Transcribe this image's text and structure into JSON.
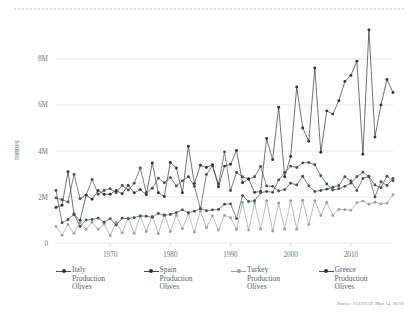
{
  "figure": {
    "background_color": "#ffffff",
    "top_rule_color": "#d8dadf",
    "source_note": "Source: FAOSTAT (Mar 14, 2019)"
  },
  "axis": {
    "ylabel": "tonnes",
    "ytick_labels": [
      "0",
      "2M",
      "4M",
      "6M",
      "8M"
    ],
    "xtick_labels": [
      "1970",
      "1980",
      "1990",
      "2000",
      "2010"
    ]
  },
  "legend": {
    "position": "bottom",
    "entries": [
      {
        "label": "Italy\nProduction\nOlives",
        "color": "#4a4f55",
        "style": "dark"
      },
      {
        "label": "Spain\nProduction\nOlives",
        "color": "#2f3338",
        "style": "dark"
      },
      {
        "label": "Turkey\nProduction\nOlives",
        "color": "#9ba0a6",
        "style": "light"
      },
      {
        "label": "Greece\nProduction\nOlives",
        "color": "#4a4f55",
        "style": "dark"
      }
    ]
  },
  "chart_data": {
    "type": "line",
    "title": "",
    "xlabel": "",
    "ylabel": "tonnes",
    "xlim": [
      1961,
      2017
    ],
    "ylim": [
      0,
      9600000
    ],
    "ytick_values": [
      0,
      2000000,
      4000000,
      6000000,
      8000000
    ],
    "xtick_values": [
      1970,
      1980,
      1990,
      2000,
      2010
    ],
    "grid": "horizontal",
    "markers": true,
    "x": [
      1961,
      1962,
      1963,
      1964,
      1965,
      1966,
      1967,
      1968,
      1969,
      1970,
      1971,
      1972,
      1973,
      1974,
      1975,
      1976,
      1977,
      1978,
      1979,
      1980,
      1981,
      1982,
      1983,
      1984,
      1985,
      1986,
      1987,
      1988,
      1989,
      1990,
      1991,
      1992,
      1993,
      1994,
      1995,
      1996,
      1997,
      1998,
      1999,
      2000,
      2001,
      2002,
      2003,
      2004,
      2005,
      2006,
      2007,
      2008,
      2009,
      2010,
      2011,
      2012,
      2013,
      2014,
      2015,
      2016,
      2017
    ],
    "series": [
      {
        "name": "Italy Production Olives",
        "color": "#4a4f55",
        "values": [
          1960000,
          1880000,
          1780000,
          2980000,
          1920000,
          2080000,
          2760000,
          2120000,
          2280000,
          2360000,
          2180000,
          2500000,
          2300000,
          2600000,
          3260000,
          2180000,
          2380000,
          2820000,
          2620000,
          2840000,
          2480000,
          2700000,
          2880000,
          2460000,
          1480000,
          2980000,
          3360000,
          2560000,
          3960000,
          2280000,
          3060000,
          2880000,
          2780000,
          2880000,
          3320000,
          2480000,
          2460000,
          2260000,
          2320000,
          2600000,
          2520000,
          2900000,
          2480000,
          2240000,
          2280000,
          2340000,
          2420000,
          2500000,
          2880000,
          2700000,
          2280000,
          2800000,
          2900000,
          2000000,
          2660000,
          2500000,
          2800000
        ]
      },
      {
        "name": "Spain Production Olives",
        "color": "#2f3338",
        "values": [
          1540000,
          1640000,
          3100000,
          1240000,
          980000,
          2080000,
          1900000,
          2280000,
          2120000,
          2120000,
          2280000,
          2140000,
          2500000,
          2180000,
          2320000,
          2100000,
          3480000,
          2180000,
          2020000,
          3500000,
          3260000,
          2180000,
          4200000,
          2580000,
          3380000,
          3280000,
          3400000,
          2440000,
          3340000,
          3420000,
          4020000,
          2620000,
          2780000,
          2200000,
          2240000,
          4540000,
          3620000,
          5900000,
          2880000,
          3760000,
          6780000,
          5000000,
          4420000,
          7600000,
          3940000,
          5740000,
          5600000,
          6180000,
          7020000,
          7280000,
          7900000,
          3860000,
          9260000,
          4600000,
          6000000,
          7100000,
          6540000
        ]
      },
      {
        "name": "Turkey Production Olives",
        "color": "#9ba0a6",
        "values": [
          720000,
          340000,
          800000,
          420000,
          880000,
          600000,
          900000,
          600000,
          820000,
          320000,
          900000,
          440000,
          1080000,
          420000,
          1160000,
          500000,
          1180000,
          400000,
          1240000,
          500000,
          1200000,
          620000,
          1260000,
          480000,
          1400000,
          660000,
          1180000,
          560000,
          1200000,
          1100000,
          600000,
          1760000,
          560000,
          1740000,
          600000,
          1840000,
          520000,
          1740000,
          600000,
          1840000,
          600000,
          1860000,
          800000,
          1840000,
          1200000,
          1760000,
          1200000,
          1460000,
          1450000,
          1420000,
          1750000,
          1820000,
          1680000,
          1770000,
          1700000,
          1730000,
          2100000
        ]
      },
      {
        "name": "Greece Production Olives",
        "color": "#4a4f55",
        "values": [
          2280000,
          880000,
          1020000,
          1260000,
          720000,
          1000000,
          1020000,
          1080000,
          900000,
          1060000,
          780000,
          1080000,
          1060000,
          1100000,
          1180000,
          1160000,
          1120000,
          1280000,
          1200000,
          1240000,
          1320000,
          1440000,
          1320000,
          1380000,
          1500000,
          1400000,
          1440000,
          1460000,
          1680000,
          1700000,
          1060000,
          2060000,
          1800000,
          1840000,
          2180000,
          2240000,
          2200000,
          2740000,
          3060000,
          3340000,
          3280000,
          3480000,
          3500000,
          3400000,
          2920000,
          2560000,
          2300000,
          2360000,
          2460000,
          2600000,
          2880000,
          3080000,
          2880000,
          2520000,
          2400000,
          2900000,
          2700000
        ]
      }
    ]
  }
}
